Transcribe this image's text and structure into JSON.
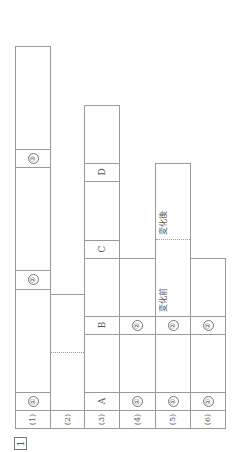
{
  "question_number": "1",
  "rows": [
    {
      "label": "(1)",
      "cells": [
        "①",
        "②",
        "③"
      ]
    },
    {
      "label": "(2)",
      "cells": []
    },
    {
      "label": "(3)",
      "cells": [
        "A",
        "B",
        "C",
        "D"
      ]
    },
    {
      "label": "(4)",
      "cells": [
        "①",
        "②"
      ]
    },
    {
      "label": "(5)",
      "cells": [
        "①",
        "②"
      ],
      "notes": [
        "変化前",
        "変化後"
      ]
    },
    {
      "label": "(6)",
      "cells": [
        "①",
        "②"
      ]
    }
  ]
}
